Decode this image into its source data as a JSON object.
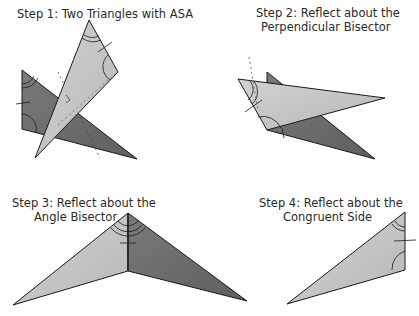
{
  "steps": [
    {
      "title_line1": "Step 1:  Two Triangles with ASA",
      "title_line2": ""
    },
    {
      "title_line1": "Step 2:  Reflect about the",
      "title_line2": "Perpendicular Bisector"
    },
    {
      "title_line1": "Step 3:  Reflect about the",
      "title_line2": "Angle Bisector"
    },
    {
      "title_line1": "Step 4:  Reflect about the",
      "title_line2": "Congruent Side"
    }
  ],
  "colors": {
    "light_triangle": "#c4c4c4",
    "dark_triangle": "#6e6e6e",
    "stroke": "#1a1a1a"
  }
}
